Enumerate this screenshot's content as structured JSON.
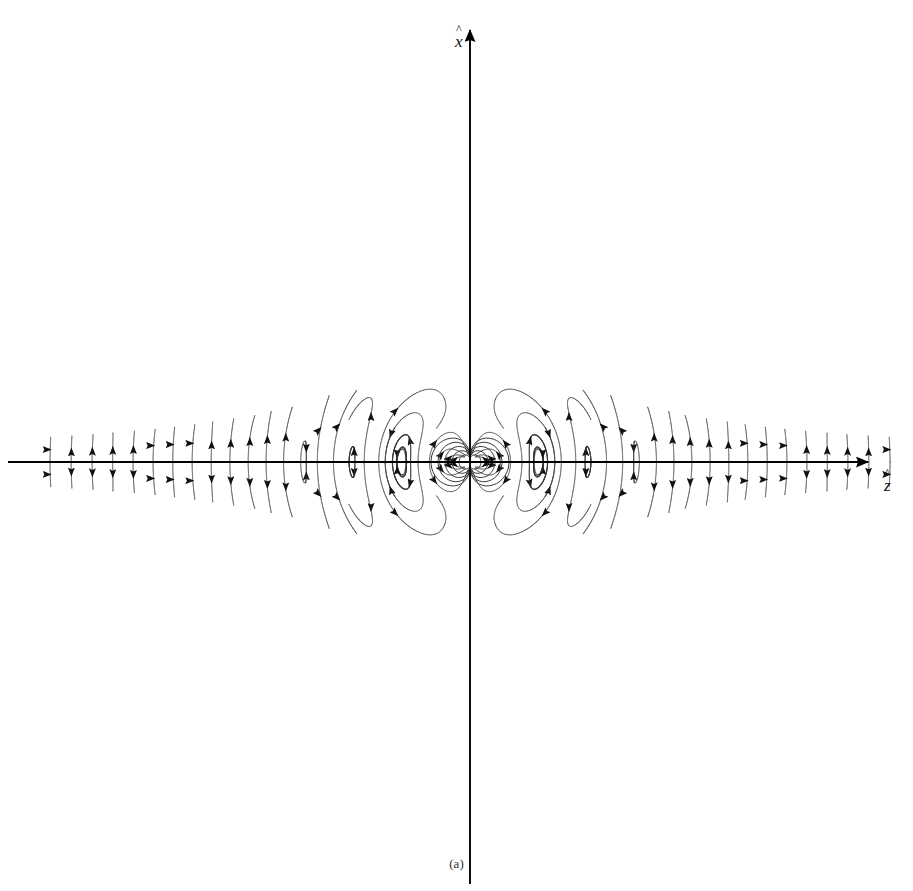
{
  "figure": {
    "caption": "(a)",
    "axes": {
      "vertical": {
        "label": "x",
        "hat": "^",
        "name": "x-hat-axis"
      },
      "horizontal": {
        "label": "z",
        "hat": "^",
        "name": "z-hat-axis"
      }
    },
    "colors": {
      "background": "#ffffff",
      "field_line": "#3a3a3a",
      "axis": "#000000",
      "arrow": "#111111",
      "caption": "#333333"
    },
    "origin": {
      "x": 470,
      "y": 462
    }
  },
  "chart_data": {
    "type": "line",
    "title": "",
    "subtitle": "",
    "xlabel": "z",
    "ylabel": "x",
    "grid": false,
    "legend": null,
    "axis_arrows": {
      "vertical": "up",
      "horizontal": "right"
    },
    "xlim": [
      -470,
      443
    ],
    "ylim": [
      -429,
      462
    ],
    "symmetry": [
      "mirror-about-vertical-axis",
      "mirror-about-horizontal-axis"
    ],
    "lobes": [
      {
        "name": "left-lobe",
        "center_direction_deg": 180,
        "n_loops": 26
      },
      {
        "name": "right-lobe",
        "center_direction_deg": 0,
        "n_loops": 26
      }
    ],
    "loop_count_per_quadrant": 26,
    "near_field_loops": 5,
    "arrowheads_per_loop": 1,
    "radial_wavelength_px": 96,
    "max_radius_px": 420,
    "min_radius_px": 16
  }
}
